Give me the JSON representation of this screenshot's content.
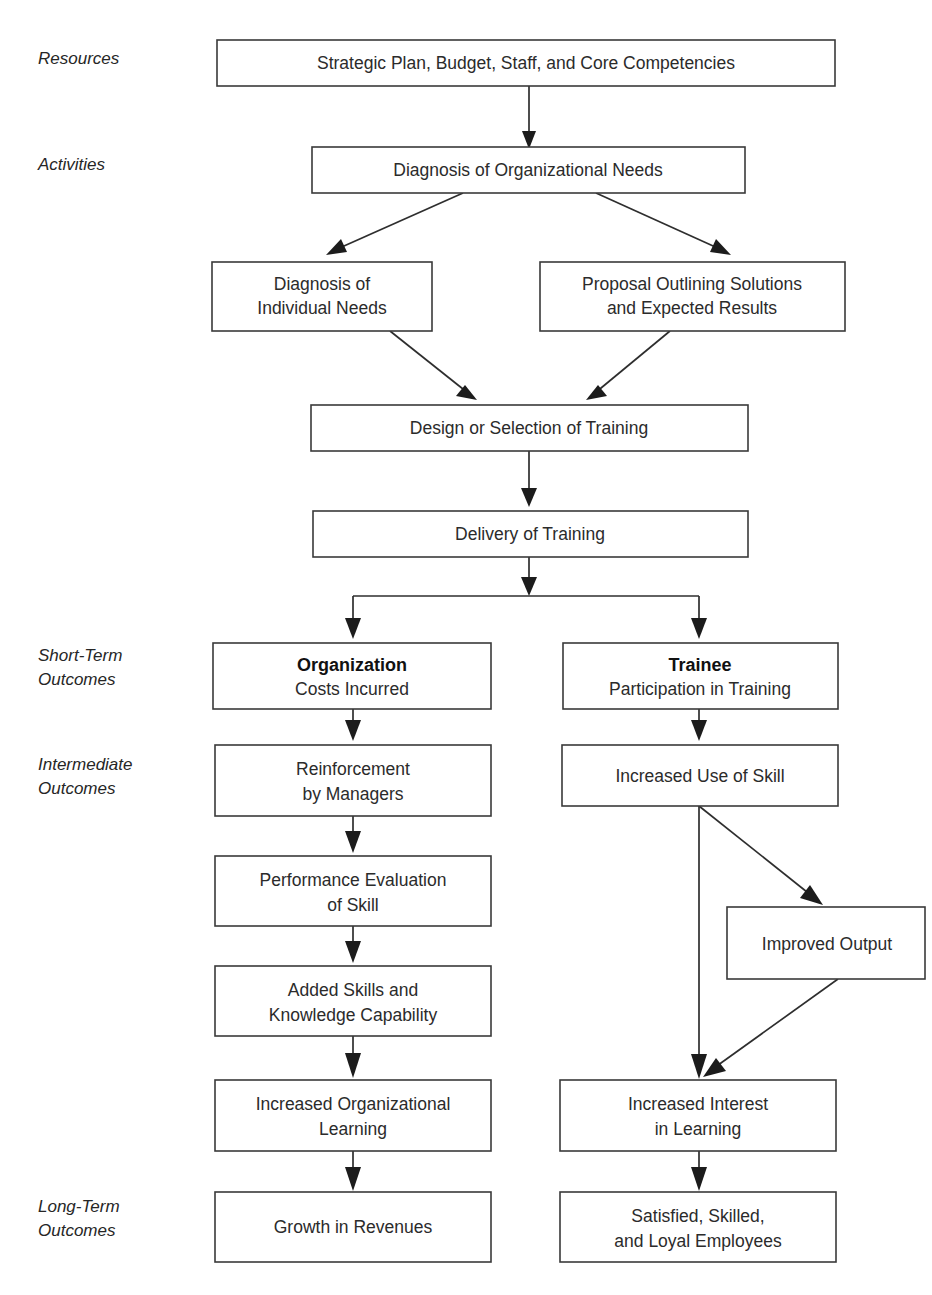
{
  "diagram": {
    "background_color": "#ffffff",
    "box_stroke_color": "#3a3a3a",
    "text_color": "#2b2b2b",
    "connector_color": "#2e2e2e"
  },
  "stage_labels": [
    {
      "id": "resources",
      "line1": "Resources",
      "line2": ""
    },
    {
      "id": "activities",
      "line1": "Activities",
      "line2": ""
    },
    {
      "id": "short-term",
      "line1": "Short-Term",
      "line2": "Outcomes"
    },
    {
      "id": "intermediate",
      "line1": "Intermediate",
      "line2": "Outcomes"
    },
    {
      "id": "long-term",
      "line1": "Long-Term",
      "line2": "Outcomes"
    }
  ],
  "boxes": {
    "strategic_plan": {
      "line1": "Strategic Plan, Budget, Staff, and Core Competencies",
      "line2": ""
    },
    "diagnosis_org": {
      "line1": "Diagnosis of Organizational Needs",
      "line2": ""
    },
    "diagnosis_individual": {
      "line1": "Diagnosis of",
      "line2": "Individual Needs"
    },
    "proposal": {
      "line1": "Proposal Outlining Solutions",
      "line2": "and Expected Results"
    },
    "design_selection": {
      "line1": "Design or Selection of Training",
      "line2": ""
    },
    "delivery": {
      "line1": "Delivery of Training",
      "line2": ""
    },
    "organization": {
      "line1": "Organization",
      "line2": "Costs Incurred"
    },
    "trainee": {
      "line1": "Trainee",
      "line2": "Participation in Training"
    },
    "reinforcement": {
      "line1": "Reinforcement",
      "line2": "by Managers"
    },
    "increased_use": {
      "line1": "Increased Use of Skill",
      "line2": ""
    },
    "performance_eval": {
      "line1": "Performance Evaluation",
      "line2": "of  Skill"
    },
    "improved_output": {
      "line1": "Improved Output",
      "line2": ""
    },
    "added_skills": {
      "line1": "Added Skills and",
      "line2": "Knowledge Capability"
    },
    "increased_org_learn": {
      "line1": "Increased Organizational",
      "line2": "Learning"
    },
    "increased_interest": {
      "line1": "Increased Interest",
      "line2": "in Learning"
    },
    "growth_revenues": {
      "line1": "Growth in Revenues",
      "line2": ""
    },
    "satisfied_employees": {
      "line1": "Satisfied, Skilled,",
      "line2": "and Loyal Employees"
    }
  }
}
